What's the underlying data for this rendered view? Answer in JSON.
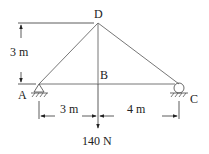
{
  "diagram": {
    "type": "truss",
    "nodes": {
      "A": {
        "label": "A",
        "support": "pin"
      },
      "B": {
        "label": "B"
      },
      "C": {
        "label": "C",
        "support": "roller"
      },
      "D": {
        "label": "D"
      }
    },
    "members": [
      "AD",
      "DC",
      "AB",
      "BC",
      "DB"
    ],
    "dimensions": {
      "height": "3 m",
      "left_span": "3 m",
      "right_span": "4 m"
    },
    "load": {
      "value": "140 N",
      "at": "B",
      "direction": "down"
    }
  }
}
